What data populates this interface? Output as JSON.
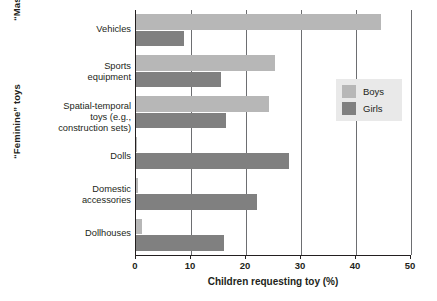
{
  "chart_data": {
    "type": "bar",
    "orientation": "horizontal",
    "title": "",
    "xlabel": "Children requesting toy (%)",
    "ylabel": "",
    "xlim": [
      0,
      50
    ],
    "xticks": [
      0,
      10,
      20,
      30,
      40,
      50
    ],
    "grid": true,
    "legend_position": "upper right",
    "categories": [
      "Vehicles",
      "Sports equipment",
      "Spatial-temporal toys (e.g., construction sets)",
      "Dolls",
      "Domestic accessories",
      "Dollhouses"
    ],
    "category_lines": [
      [
        "Vehicles"
      ],
      [
        "Sports",
        "equipment"
      ],
      [
        "Spatial-temporal",
        "toys (e.g.,",
        "construction sets)"
      ],
      [
        "Dolls"
      ],
      [
        "Domestic",
        "accessories"
      ],
      [
        "Dollhouses"
      ]
    ],
    "series": [
      {
        "name": "Boys",
        "color": "#b7b7b7",
        "values": [
          44.5,
          25.3,
          24.2,
          0.2,
          0.3,
          1.0
        ]
      },
      {
        "name": "Girls",
        "color": "#808080",
        "values": [
          8.7,
          15.5,
          16.4,
          27.8,
          22.0,
          16.0
        ]
      }
    ],
    "group_labels": [
      {
        "text": "“Masculine” toys",
        "categories": [
          "Vehicles",
          "Sports equipment",
          "Spatial-temporal toys (e.g., construction sets)"
        ]
      },
      {
        "text": "“Feminine” toys",
        "categories": [
          "Dolls",
          "Domestic accessories",
          "Dollhouses"
        ]
      }
    ]
  },
  "axis": {
    "tick_labels": [
      "0",
      "10",
      "20",
      "30",
      "40",
      "50"
    ],
    "x_title": "Children requesting toy (%)"
  },
  "legend": {
    "items": [
      {
        "label": "Boys",
        "color": "#b7b7b7"
      },
      {
        "label": "Girls",
        "color": "#808080"
      }
    ]
  },
  "groups": {
    "masculine": "“Masculine” toys",
    "feminine": "“Feminine” toys"
  },
  "categories": {
    "c0_l0": "Vehicles",
    "c1_l0": "Sports",
    "c1_l1": "equipment",
    "c2_l0": "Spatial-temporal",
    "c2_l1": "toys (e.g.,",
    "c2_l2": "construction sets)",
    "c3_l0": "Dolls",
    "c4_l0": "Domestic",
    "c4_l1": "accessories",
    "c5_l0": "Dollhouses"
  }
}
